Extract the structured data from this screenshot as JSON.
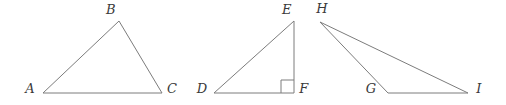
{
  "figure": {
    "width": 506,
    "height": 105,
    "background_color": "#ffffff",
    "stroke_color": "#7c7c7c",
    "stroke_width": 1,
    "label_color": "#3a3a3a"
  },
  "shapes": [
    {
      "id": "triangle-abc",
      "name": "triangle-abc",
      "kind": "triangle",
      "type": "acute",
      "points": "43,93 119,21 162,93",
      "vertices": [
        {
          "label": "A",
          "name": "vertex-label-a",
          "x": 43,
          "y": 93,
          "label_x": 30,
          "label_y": 88
        },
        {
          "label": "B",
          "name": "vertex-label-b",
          "x": 119,
          "y": 21,
          "label_x": 111,
          "label_y": 9
        },
        {
          "label": "C",
          "name": "vertex-label-c",
          "x": 162,
          "y": 93,
          "label_x": 172,
          "label_y": 88
        }
      ],
      "right_angle_marker": null
    },
    {
      "id": "triangle-def",
      "name": "triangle-def",
      "kind": "triangle",
      "type": "right",
      "points": "214,93 294,21 294,93",
      "vertices": [
        {
          "label": "D",
          "name": "vertex-label-d",
          "x": 214,
          "y": 93,
          "label_x": 202,
          "label_y": 88
        },
        {
          "label": "E",
          "name": "vertex-label-e",
          "x": 294,
          "y": 21,
          "label_x": 287,
          "label_y": 9
        },
        {
          "label": "F",
          "name": "vertex-label-f",
          "x": 294,
          "y": 93,
          "label_x": 304,
          "label_y": 88
        }
      ],
      "right_angle_marker": {
        "name": "right-angle-marker-f",
        "points": "281,93 281,80 294,80"
      }
    },
    {
      "id": "triangle-hgi",
      "name": "triangle-hgi",
      "kind": "triangle",
      "type": "obtuse",
      "points": "320,22 388,93 468,93",
      "vertices": [
        {
          "label": "H",
          "name": "vertex-label-h",
          "x": 320,
          "y": 22,
          "label_x": 322,
          "label_y": 8
        },
        {
          "label": "G",
          "name": "vertex-label-g",
          "x": 388,
          "y": 93,
          "label_x": 371,
          "label_y": 88
        },
        {
          "label": "I",
          "name": "vertex-label-i",
          "x": 468,
          "y": 93,
          "label_x": 479,
          "label_y": 88
        }
      ],
      "right_angle_marker": null
    }
  ]
}
